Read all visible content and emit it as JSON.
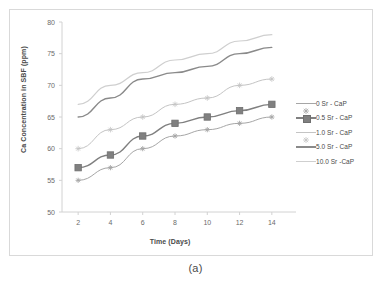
{
  "figure": {
    "caption": "(a)"
  },
  "chart_data": {
    "type": "line",
    "title": "",
    "xlabel": "Time (Days)",
    "ylabel": "Ca Concentration in SBF (ppm)",
    "x": [
      2,
      4,
      6,
      8,
      10,
      12,
      14
    ],
    "xticklabels": [
      "2",
      "4",
      "6",
      "8",
      "10",
      "12",
      "14"
    ],
    "yticklabels": [
      "50",
      "55",
      "60",
      "65",
      "70",
      "75",
      "80"
    ],
    "xlim": [
      1,
      15
    ],
    "ylim": [
      50,
      80
    ],
    "ytick_step": 5,
    "grid": false,
    "legend_position": "right",
    "series": [
      {
        "name": "0 Sr - CaP",
        "values": [
          55,
          57,
          60,
          62,
          63,
          64,
          65
        ],
        "color": "#a6a6a6",
        "marker": "cross-small",
        "linewidth": 1
      },
      {
        "name": "0.5 Sr - CaP",
        "values": [
          57,
          59,
          62,
          64,
          65,
          66,
          67
        ],
        "color": "#808080",
        "marker": "square",
        "linewidth": 1.4
      },
      {
        "name": "1.0 Sr - CaP",
        "values": [
          60,
          63,
          65,
          67,
          68,
          70,
          71
        ],
        "color": "#c4c4c4",
        "marker": "star-small",
        "linewidth": 1
      },
      {
        "name": "5.0 Sr - CaP",
        "values": [
          65,
          68,
          71,
          72,
          73,
          75,
          76
        ],
        "color": "#8a8a8a",
        "marker": "none",
        "linewidth": 1.4
      },
      {
        "name": "10.0 Sr -CaP",
        "values": [
          67,
          70,
          72,
          74,
          75,
          77,
          78
        ],
        "color": "#cfcfcf",
        "marker": "none",
        "linewidth": 1.2
      }
    ]
  }
}
